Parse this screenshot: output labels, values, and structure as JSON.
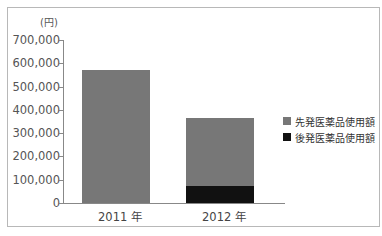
{
  "chart_data": {
    "type": "bar",
    "stacked": true,
    "title": "",
    "xlabel": "",
    "ylabel": "(円)",
    "ylim": [
      0,
      700000
    ],
    "yticks": [
      "0",
      "100,000",
      "200,000",
      "300,000",
      "400,000",
      "500,000",
      "600,000",
      "700,000"
    ],
    "categories": [
      "2011 年",
      "2012 年"
    ],
    "series": [
      {
        "name": "後発医薬品使用額",
        "color": "#111111",
        "values": [
          0,
          75000
        ]
      },
      {
        "name": "先発医薬品使用額",
        "color": "#777777",
        "values": [
          570000,
          290000
        ]
      }
    ],
    "legend_position": "right",
    "grid": false
  },
  "legend": [
    {
      "label": "先発医薬品使用額",
      "color": "#777777"
    },
    {
      "label": "後発医薬品使用額",
      "color": "#111111"
    }
  ]
}
